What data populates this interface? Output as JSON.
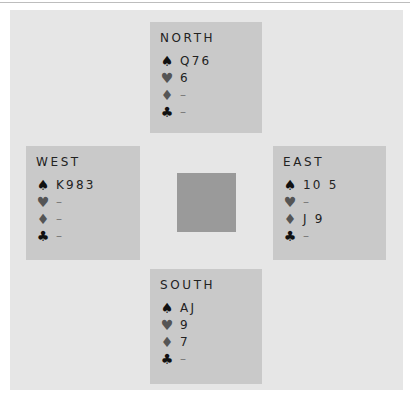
{
  "diagram": {
    "center_color": "#9a9a9a",
    "hands": {
      "north": {
        "label": "NORTH",
        "spades": "Q76",
        "hearts": "6",
        "diamonds": "–",
        "clubs": "–"
      },
      "west": {
        "label": "WEST",
        "spades": "K983",
        "hearts": "–",
        "diamonds": "–",
        "clubs": "–"
      },
      "east": {
        "label": "EAST",
        "spades": "10 5",
        "hearts": "–",
        "diamonds": "J 9",
        "clubs": "–"
      },
      "south": {
        "label": "SOUTH",
        "spades": "AJ",
        "hearts": "9",
        "diamonds": "7",
        "clubs": "–"
      }
    },
    "suits": {
      "spades": "♠",
      "hearts": "♥",
      "diamonds": "♦",
      "clubs": "♣"
    }
  }
}
